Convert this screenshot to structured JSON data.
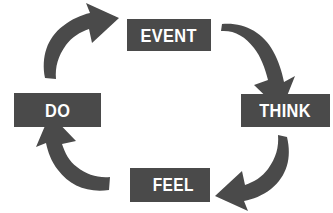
{
  "diagram": {
    "type": "cycle-diagram",
    "direction": "clockwise",
    "background_color": "#ffffff",
    "node_fill_color": "#4a4a4a",
    "node_text_color": "#ffffff",
    "arrow_color": "#4a4a4a",
    "nodes": [
      {
        "id": "event",
        "label": "EVENT",
        "position": "top"
      },
      {
        "id": "think",
        "label": "THINK",
        "position": "right"
      },
      {
        "id": "feel",
        "label": "FEEL",
        "position": "bottom"
      },
      {
        "id": "do",
        "label": "DO",
        "position": "left"
      }
    ],
    "arrows": [
      {
        "id": "event-to-think",
        "icon": "curved-arrow-icon",
        "from": "event",
        "to": "think",
        "position": "top-right"
      },
      {
        "id": "think-to-feel",
        "icon": "curved-arrow-icon",
        "from": "think",
        "to": "feel",
        "position": "bottom-right"
      },
      {
        "id": "feel-to-do",
        "icon": "curved-arrow-icon",
        "from": "feel",
        "to": "do",
        "position": "bottom-left"
      },
      {
        "id": "do-to-event",
        "icon": "curved-arrow-icon",
        "from": "do",
        "to": "event",
        "position": "top-left"
      }
    ]
  }
}
